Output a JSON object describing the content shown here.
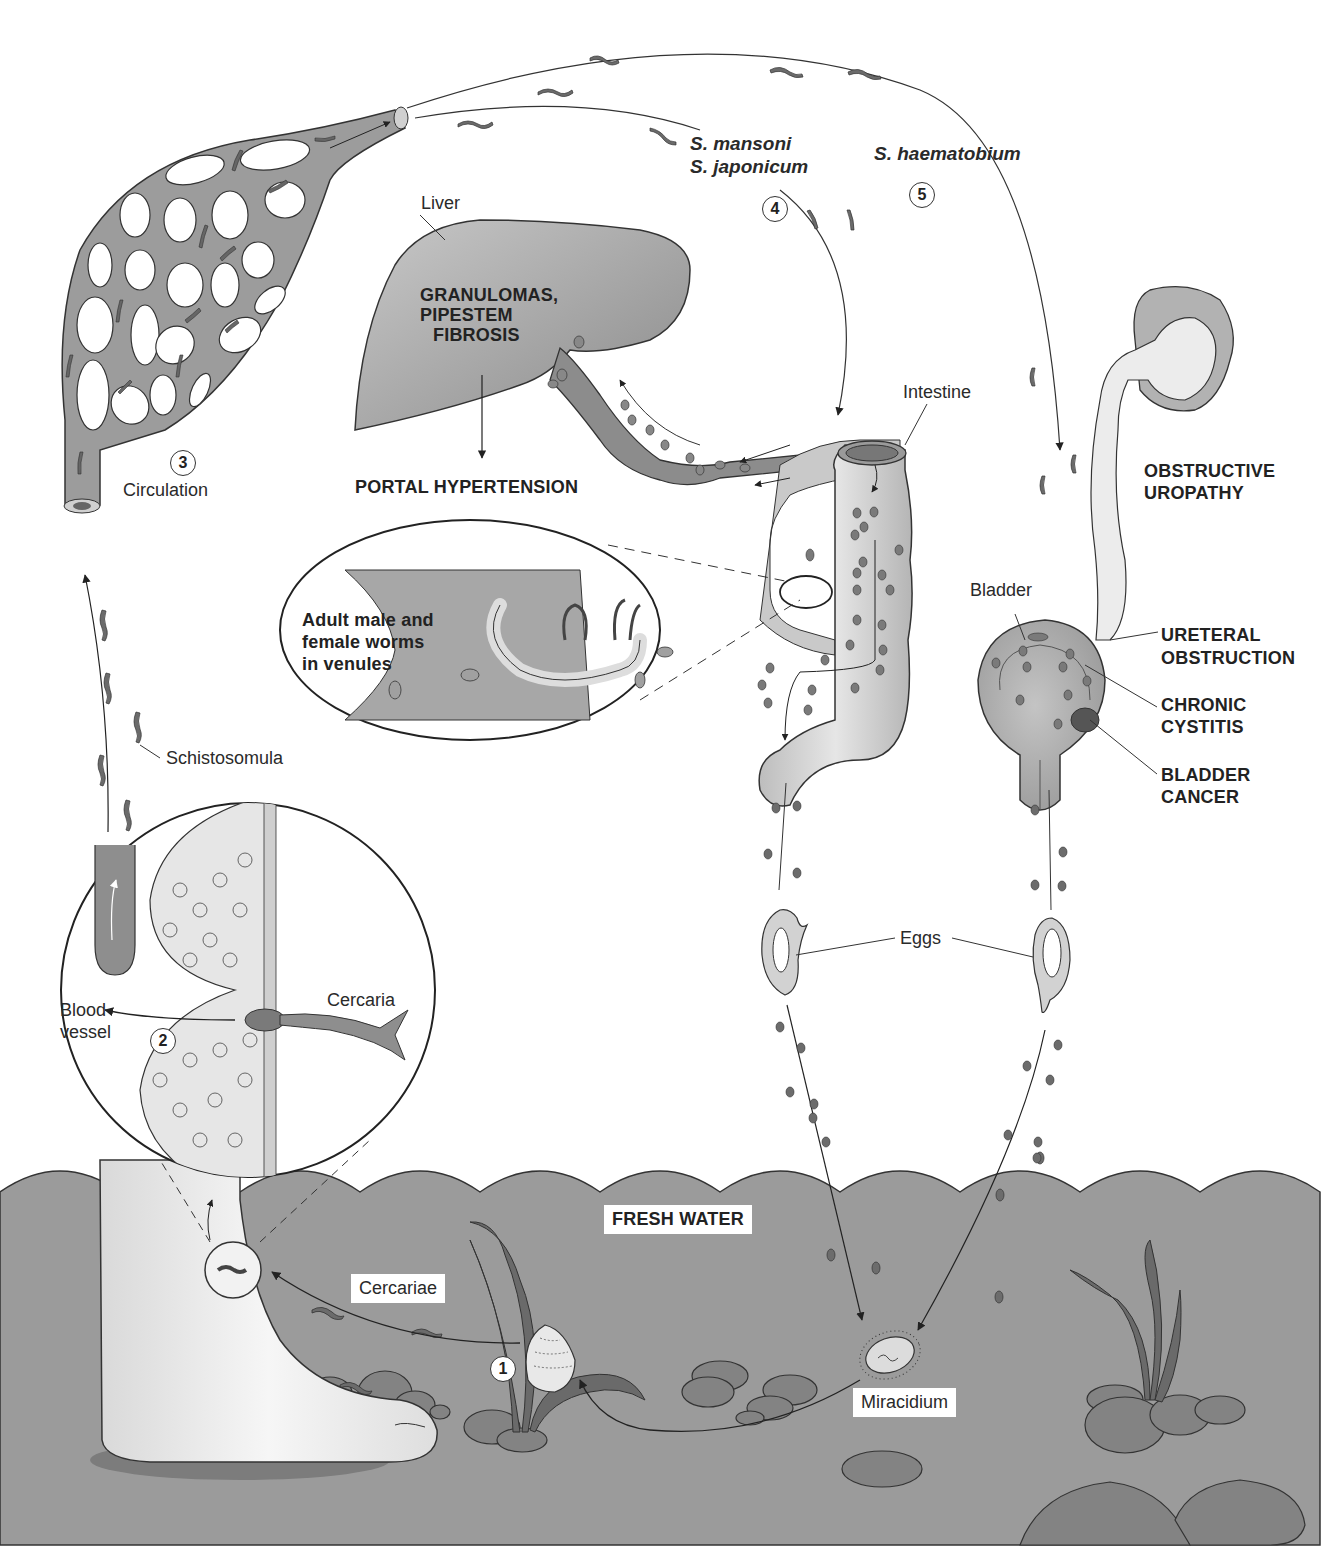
{
  "figure": {
    "clipped_header": "",
    "steps": [
      {
        "number": "1",
        "label": "Cercariae"
      },
      {
        "number": "2",
        "label": "Blood vessel"
      },
      {
        "number": "3",
        "label": "Circulation"
      },
      {
        "number": "4",
        "label": "S. mansoni / S. japonicum"
      },
      {
        "number": "5",
        "label": "S. haematobium"
      }
    ],
    "labels": {
      "circulation": "Circulation",
      "s_mansoni": "S. mansoni",
      "s_japonicum": "S. japonicum",
      "s_haematobium": "S. haematobium",
      "liver": "Liver",
      "liver_effects_1": "GRANULOMAS,",
      "liver_effects_2": "PIPESTEM",
      "liver_effects_3": "FIBROSIS",
      "portal_hypertension": "PORTAL HYPERTENSION",
      "intestine": "Intestine",
      "adult_worms_1": "Adult male and",
      "adult_worms_2": "female worms",
      "adult_worms_3": "in venules",
      "obstructive_1": "OBSTRUCTIVE",
      "obstructive_2": "UROPATHY",
      "bladder": "Bladder",
      "ureteral_1": "URETERAL",
      "ureteral_2": "OBSTRUCTION",
      "cystitis_1": "CHRONIC",
      "cystitis_2": "CYSTITIS",
      "cancer_1": "BLADDER",
      "cancer_2": "CANCER",
      "schistosomula": "Schistosomula",
      "blood_1": "Blood",
      "blood_2": "vessel",
      "cercaria": "Cercaria",
      "eggs": "Eggs",
      "fresh_water": "FRESH WATER",
      "cercariae": "Cercariae",
      "miracidium": "Miracidium"
    },
    "colors": {
      "water": "#9a9a9a",
      "tissue_gray": "#8c8c8c",
      "light_gray": "#d6d6d6",
      "outline": "#2a2a2a",
      "worm": "#6e6e6e",
      "background": "#ffffff"
    }
  }
}
